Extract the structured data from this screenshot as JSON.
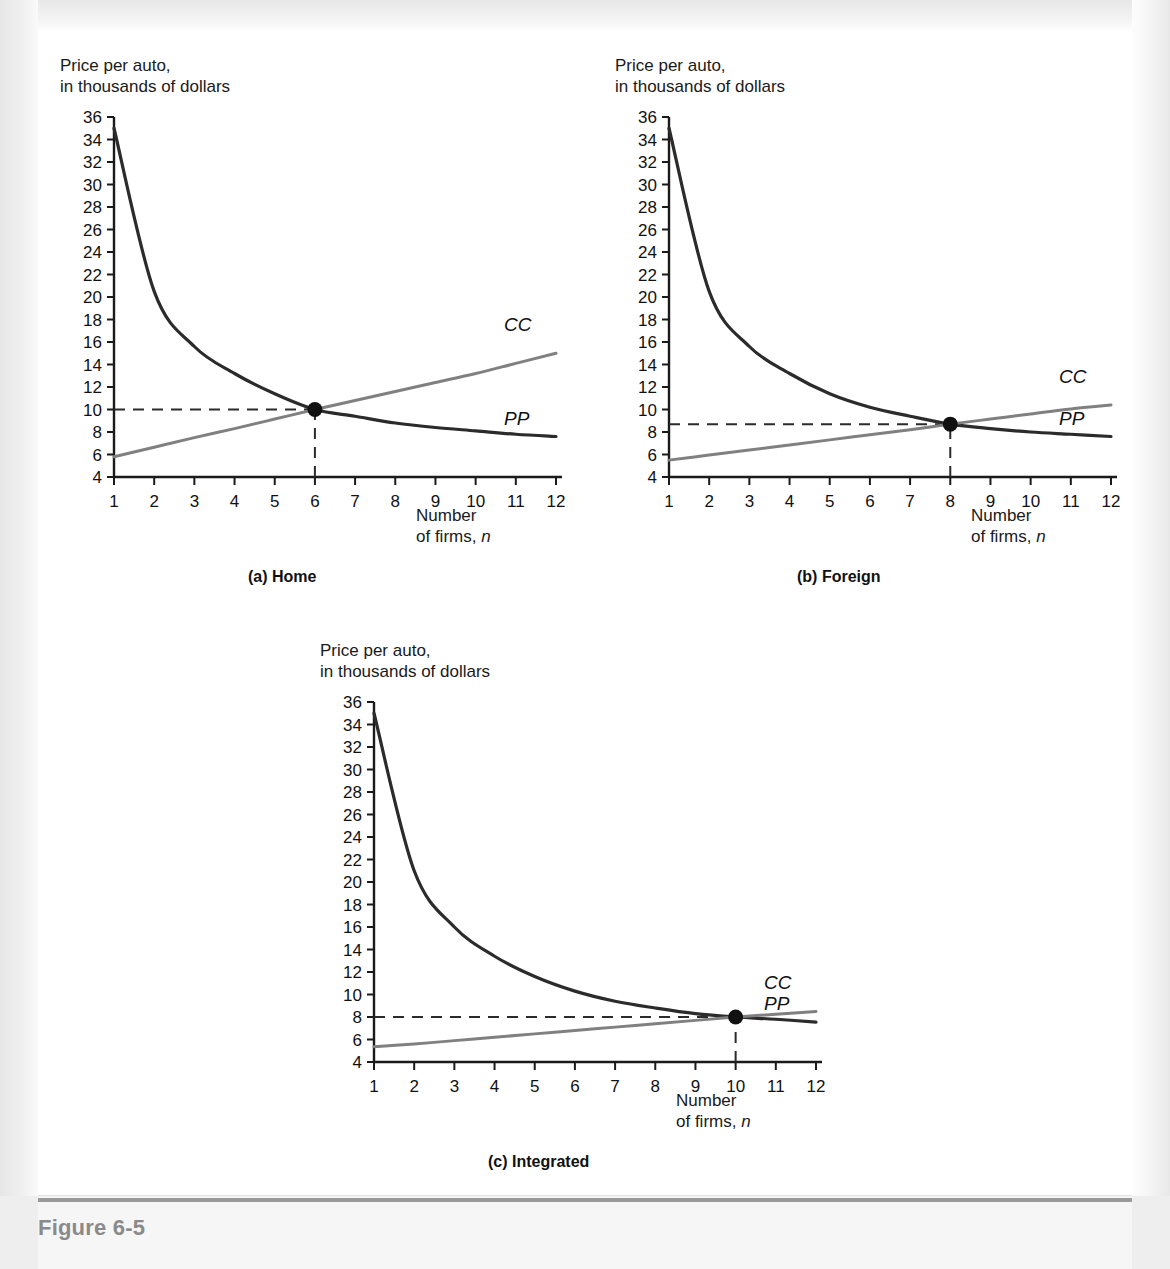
{
  "figure": {
    "caption": "Figure 6-5",
    "y_axis_title_line1": "Price per auto,",
    "y_axis_title_line2": "in thousands of dollars",
    "x_axis_title_line1": "Number",
    "x_axis_title_line2_prefix": "of firms, ",
    "x_axis_title_line2_italic": "n"
  },
  "panels": [
    {
      "id": "home",
      "caption": "(a) Home",
      "cc_label": "CC",
      "pp_label": "PP",
      "equilibrium_n": 6,
      "equilibrium_price": 10
    },
    {
      "id": "foreign",
      "caption": "(b) Foreign",
      "cc_label": "CC",
      "pp_label": "PP",
      "equilibrium_n": 8,
      "equilibrium_price": 8.7
    },
    {
      "id": "integrated",
      "caption": "(c) Integrated",
      "cc_label": "CC",
      "pp_label": "PP",
      "equilibrium_n": 10,
      "equilibrium_price": 8
    }
  ],
  "colors": {
    "cc_curve": "#808080",
    "pp_curve": "#2b2b2b",
    "axis": "#1a1a1a",
    "dashed": "#2b2b2b",
    "caption_gray": "#8a8a8a"
  },
  "chart_data": [
    {
      "type": "line",
      "title": "(a) Home",
      "xlabel": "Number of firms, n",
      "ylabel": "Price per auto, in thousands of dollars",
      "xlim": [
        1,
        12
      ],
      "ylim": [
        4,
        36
      ],
      "xticks": [
        1,
        2,
        3,
        4,
        5,
        6,
        7,
        8,
        9,
        10,
        11,
        12
      ],
      "yticks": [
        4,
        6,
        8,
        10,
        12,
        14,
        16,
        18,
        20,
        22,
        24,
        26,
        28,
        30,
        32,
        34,
        36
      ],
      "grid": false,
      "legend": "inline-curve-labels",
      "x": [
        1,
        2,
        3,
        4,
        5,
        6,
        7,
        8,
        9,
        10,
        11,
        12
      ],
      "series": [
        {
          "name": "PP",
          "note": "downward sloping price curve",
          "values": [
            35.0,
            20.5,
            15.6,
            13.2,
            11.4,
            10.0,
            9.4,
            8.8,
            8.4,
            8.1,
            7.8,
            7.6
          ]
        },
        {
          "name": "CC",
          "note": "upward sloping average cost curve",
          "values": [
            5.8,
            6.65,
            7.5,
            8.3,
            9.15,
            10.0,
            10.8,
            11.6,
            12.4,
            13.2,
            14.1,
            15.0
          ]
        }
      ],
      "annotations": [
        {
          "type": "point",
          "label": "equilibrium",
          "x": 6,
          "y": 10
        },
        {
          "type": "hline",
          "y": 10,
          "style": "dashed",
          "from_x": 1,
          "to_x": 6
        },
        {
          "type": "vline",
          "x": 6,
          "style": "dashed",
          "from_y": 4,
          "to_y": 10
        }
      ]
    },
    {
      "type": "line",
      "title": "(b) Foreign",
      "xlabel": "Number of firms, n",
      "ylabel": "Price per auto, in thousands of dollars",
      "xlim": [
        1,
        12
      ],
      "ylim": [
        4,
        36
      ],
      "xticks": [
        1,
        2,
        3,
        4,
        5,
        6,
        7,
        8,
        9,
        10,
        11,
        12
      ],
      "yticks": [
        4,
        6,
        8,
        10,
        12,
        14,
        16,
        18,
        20,
        22,
        24,
        26,
        28,
        30,
        32,
        34,
        36
      ],
      "grid": false,
      "legend": "inline-curve-labels",
      "x": [
        1,
        2,
        3,
        4,
        5,
        6,
        7,
        8,
        9,
        10,
        11,
        12
      ],
      "series": [
        {
          "name": "PP",
          "note": "downward sloping price curve",
          "values": [
            35.0,
            20.5,
            15.6,
            13.2,
            11.4,
            10.2,
            9.4,
            8.7,
            8.3,
            8.0,
            7.8,
            7.6
          ]
        },
        {
          "name": "CC",
          "note": "upward sloping average cost curve, flatter than Home",
          "values": [
            5.5,
            5.95,
            6.4,
            6.85,
            7.3,
            7.75,
            8.2,
            8.7,
            9.15,
            9.6,
            10.05,
            10.4
          ]
        }
      ],
      "annotations": [
        {
          "type": "point",
          "label": "equilibrium",
          "x": 8,
          "y": 8.7
        },
        {
          "type": "hline",
          "y": 8.7,
          "style": "dashed",
          "from_x": 1,
          "to_x": 8
        },
        {
          "type": "vline",
          "x": 8,
          "style": "dashed",
          "from_y": 4,
          "to_y": 8.7
        }
      ]
    },
    {
      "type": "line",
      "title": "(c) Integrated",
      "xlabel": "Number of firms, n",
      "ylabel": "Price per auto, in thousands of dollars",
      "xlim": [
        1,
        12
      ],
      "ylim": [
        4,
        36
      ],
      "xticks": [
        1,
        2,
        3,
        4,
        5,
        6,
        7,
        8,
        9,
        10,
        11,
        12
      ],
      "yticks": [
        4,
        6,
        8,
        10,
        12,
        14,
        16,
        18,
        20,
        22,
        24,
        26,
        28,
        30,
        32,
        34,
        36
      ],
      "grid": false,
      "legend": "inline-curve-labels",
      "x": [
        1,
        2,
        3,
        4,
        5,
        6,
        7,
        8,
        9,
        10,
        11,
        12
      ],
      "series": [
        {
          "name": "PP",
          "note": "downward sloping price curve",
          "values": [
            35.0,
            21.0,
            16.0,
            13.4,
            11.6,
            10.3,
            9.4,
            8.8,
            8.3,
            8.0,
            7.8,
            7.55
          ]
        },
        {
          "name": "CC",
          "note": "upward sloping average cost curve, flattest of the three",
          "values": [
            5.35,
            5.6,
            5.9,
            6.2,
            6.5,
            6.8,
            7.1,
            7.4,
            7.7,
            8.0,
            8.25,
            8.5
          ]
        }
      ],
      "annotations": [
        {
          "type": "point",
          "label": "equilibrium",
          "x": 10,
          "y": 8
        },
        {
          "type": "hline",
          "y": 8,
          "style": "dashed",
          "from_x": 1,
          "to_x": 10
        },
        {
          "type": "vline",
          "x": 10,
          "style": "dashed",
          "from_y": 4,
          "to_y": 8
        }
      ]
    }
  ]
}
